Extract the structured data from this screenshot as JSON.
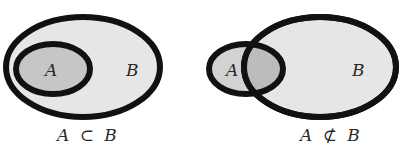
{
  "colors": {
    "background": "#ffffff",
    "set_b_fill": "#e6e6e6",
    "set_a_fill": "#c6c6c6",
    "intersection_fill": "#bcbcbc",
    "stroke": "#111111",
    "text": "#2a2a2a"
  },
  "diagrams": [
    {
      "id": "subset",
      "set_a_label": "A",
      "set_b_label": "B",
      "caption": {
        "left": "A",
        "symbol": "⊂",
        "right": "B"
      }
    },
    {
      "id": "not-subset",
      "set_a_label": "A",
      "set_b_label": "B",
      "caption": {
        "left": "A",
        "symbol": "⊄",
        "right": "B"
      }
    }
  ]
}
